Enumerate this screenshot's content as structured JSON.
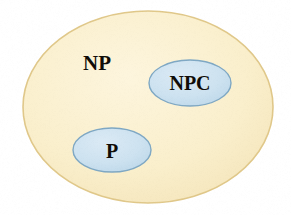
{
  "figure": {
    "background_color": "#ffffff",
    "width": 291,
    "height": 215
  },
  "chart_data": {
    "type": "diagram",
    "diagram_kind": "euler-venn",
    "title": "",
    "sets": [
      {
        "id": "np",
        "label": "NP",
        "role": "outer-set",
        "shape": "ellipse",
        "cx": 148,
        "cy": 107,
        "rx": 125,
        "ry": 96,
        "fill": "#f9edc8",
        "stroke": "#e0c88a",
        "stroke_width": 1.6,
        "label_x": 97,
        "label_y": 70,
        "label_anchor": "middle",
        "contains": [
          "npc",
          "p"
        ]
      },
      {
        "id": "npc",
        "label": "NPC",
        "role": "inner-set",
        "shape": "ellipse",
        "cx": 190,
        "cy": 83,
        "rx": 41,
        "ry": 23,
        "fill": "#cfe3f0",
        "stroke": "#7fa8c4",
        "stroke_width": 1.4,
        "label_x": 190,
        "label_y": 90,
        "label_anchor": "middle",
        "contains": []
      },
      {
        "id": "p",
        "label": "P",
        "role": "inner-set",
        "shape": "ellipse",
        "cx": 112,
        "cy": 150,
        "rx": 39,
        "ry": 22,
        "fill": "#cfe3f0",
        "stroke": "#7fa8c4",
        "stroke_width": 1.4,
        "label_x": 112,
        "label_y": 158,
        "label_anchor": "middle",
        "contains": []
      }
    ],
    "relations": [
      "P is a subset of NP",
      "NPC is a subset of NP",
      "P and NPC are disjoint as drawn"
    ],
    "legend": [],
    "annotations": []
  },
  "colors": {
    "np_fill": "#f9edc8",
    "np_stroke": "#e0c88a",
    "inner_fill": "#cfe3f0",
    "inner_stroke": "#7fa8c4",
    "label_text": "#100d08",
    "page_background": "#ffffff"
  }
}
